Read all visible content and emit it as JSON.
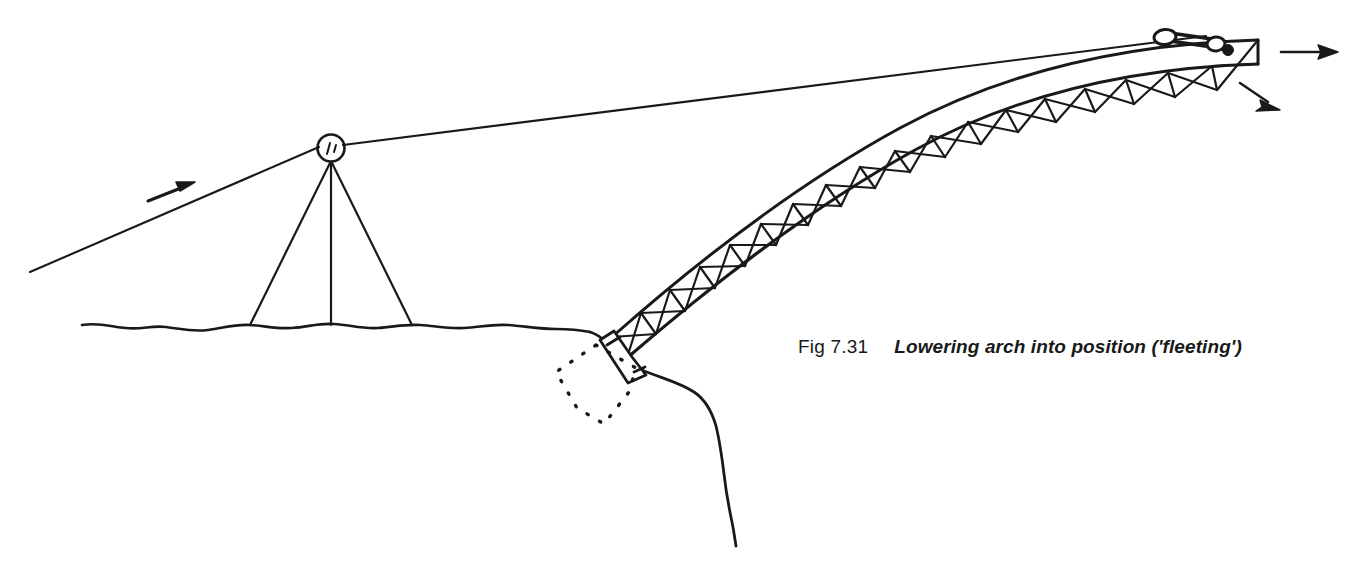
{
  "figure": {
    "number": "Fig 7.31",
    "title": "Lowering arch into position ('fleeting')",
    "line_color": "#191919",
    "background_color": "#ffffff"
  },
  "diagram": {
    "elements": {
      "ground_label": "ground line",
      "cliff_label": "cliff face",
      "tower_label": "guyed A-frame tower",
      "pulley_label": "head sheave",
      "cable_label": "hauling rope",
      "arch_label": "lattice arch rib",
      "arch_foot_label": "arch foot bearing shoe",
      "final_position_label": "final position (dotted)",
      "fleeting_block_label": "fleeting block / travelling sheaves",
      "arrow_rope_label": "rope pull direction",
      "arrow_horizontal_label": "horizontal travel direction",
      "arrow_diagonal_label": "lowering direction"
    }
  }
}
